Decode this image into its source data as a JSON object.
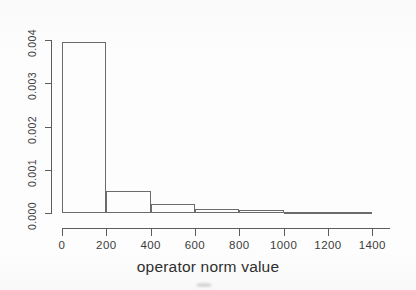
{
  "chart_data": {
    "type": "bar",
    "title": "",
    "subtitle": "",
    "xlabel": "operator norm value",
    "ylabel": "",
    "bin_width": 200,
    "bin_edges": [
      0,
      200,
      400,
      600,
      800,
      1000,
      1200,
      1400
    ],
    "categories": [
      "0-200",
      "200-400",
      "400-600",
      "600-800",
      "800-1000",
      "1000-1200",
      "1200-1400"
    ],
    "values": [
      0.00395,
      0.0005,
      0.00022,
      0.0001,
      6e-05,
      3e-05,
      2e-05
    ],
    "xlim": [
      0,
      1480
    ],
    "ylim": [
      0,
      0.004
    ],
    "xticks": [
      0,
      200,
      400,
      600,
      800,
      1000,
      1200,
      1400
    ],
    "xtick_labels": [
      "0",
      "200",
      "400",
      "600",
      "800",
      "1000",
      "1200",
      "1400"
    ],
    "yticks": [
      0.0,
      0.001,
      0.002,
      0.003,
      0.004
    ],
    "ytick_labels": [
      "0.000",
      "0.001",
      "0.002",
      "0.003",
      "0.004"
    ],
    "grid": false,
    "legend": null,
    "legend_position": "none",
    "annotations": [],
    "colors": {
      "bar_edge": "#6b6b6b",
      "bar_fill": "transparent",
      "axis": "#5d5d5d",
      "text": "#3c3c3c",
      "background": "#fdfdfd"
    }
  }
}
